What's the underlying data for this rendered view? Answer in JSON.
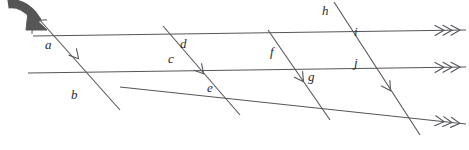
{
  "figure": {
    "width": 469,
    "height": 150,
    "background_color": "#ffffff",
    "line_color": "#55565a",
    "label_color": "#2b2b2b",
    "pointer_color": "#565656"
  },
  "parallel_lines": {
    "marker": "triple-arrowhead",
    "marker_count": 3,
    "count": 3,
    "items": [
      {
        "id": "line-top",
        "x1": 33,
        "y1": 36,
        "x2": 466,
        "y2": 30,
        "arrow_at": "right"
      },
      {
        "id": "line-middle",
        "x1": 28,
        "y1": 73,
        "x2": 466,
        "y2": 67,
        "arrow_at": "right"
      },
      {
        "id": "line-bottom",
        "x1": 120,
        "y1": 87,
        "x2": 466,
        "y2": 124,
        "arrow_at": "right"
      }
    ]
  },
  "transversals": {
    "marker": "single-chevron",
    "marker_count": 1,
    "count": 4,
    "items": [
      {
        "id": "transversal-1",
        "x1": 38,
        "y1": 18,
        "x2": 120,
        "y2": 110,
        "chevron_x": 78,
        "chevron_y": 58
      },
      {
        "id": "transversal-2",
        "x1": 163,
        "y1": 26,
        "x2": 240,
        "y2": 115,
        "chevron_x": 203,
        "chevron_y": 73
      },
      {
        "id": "transversal-3",
        "x1": 268,
        "y1": 30,
        "x2": 330,
        "y2": 120,
        "chevron_x": 303,
        "chevron_y": 81
      },
      {
        "id": "transversal-4",
        "x1": 334,
        "y1": 2,
        "x2": 420,
        "y2": 135,
        "chevron_x": 390,
        "chevron_y": 90
      }
    ]
  },
  "angle_labels": [
    {
      "letter": "a",
      "x": 45,
      "y": 38
    },
    {
      "letter": "b",
      "x": 71,
      "y": 88
    },
    {
      "letter": "c",
      "x": 168,
      "y": 52
    },
    {
      "letter": "d",
      "x": 180,
      "y": 37
    },
    {
      "letter": "e",
      "x": 207,
      "y": 81
    },
    {
      "letter": "f",
      "x": 270,
      "y": 45
    },
    {
      "letter": "g",
      "x": 308,
      "y": 70
    },
    {
      "letter": "h",
      "x": 322,
      "y": 4
    },
    {
      "letter": "i",
      "x": 354,
      "y": 25
    },
    {
      "letter": "j",
      "x": 354,
      "y": 56
    }
  ],
  "pointer": {
    "name": "curved-arrow-pointer",
    "points_to": "angle-a",
    "description": "thick curved arrow from top-left pointing down-right at the marked angle"
  },
  "angle_arc": {
    "name": "angle-arc-a",
    "cx": 45,
    "cy": 30,
    "r": 13
  }
}
